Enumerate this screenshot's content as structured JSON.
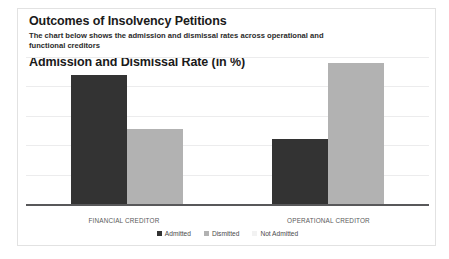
{
  "card": {
    "title": "Outcomes of Insolvency Petitions",
    "subtitle": "The chart below shows the admission and dismissal rates across operational and functional creditors",
    "chart_heading": "Admission and Dismissal Rate (in %)"
  },
  "chart_data": {
    "type": "bar",
    "title": "Admission and Dismissal Rate (in %)",
    "subtitle": "The chart below shows the admission and dismissal rates across operational and functional creditors",
    "xlabel": "",
    "ylabel": "",
    "ylim": [
      0,
      100
    ],
    "grid": true,
    "gridlines": [
      0,
      20,
      40,
      60,
      80,
      100
    ],
    "legend_position": "bottom",
    "categories": [
      "FINANCIAL CREDITOR",
      "OPERATIONAL CREDITOR"
    ],
    "series": [
      {
        "name": "Admitted",
        "color": "#333333",
        "values": [
          88,
          44
        ]
      },
      {
        "name": "Dismitted",
        "color": "#b2b2b2",
        "values": [
          51,
          96
        ]
      },
      {
        "name": "Not Admitted",
        "color": "#f2f2f2",
        "values": [
          0,
          0
        ]
      }
    ]
  }
}
